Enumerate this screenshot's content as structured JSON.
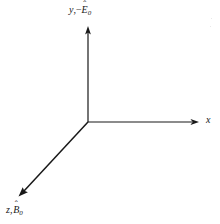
{
  "figure": {
    "type": "coordinate-axes-diagram",
    "background_color": "#ffffff",
    "stroke_color": "#181818",
    "width": 220,
    "height": 224,
    "origin": {
      "x": 88,
      "y": 122
    },
    "axes": [
      {
        "id": "y",
        "name": "y-axis",
        "direction": "up",
        "from": {
          "x": 88,
          "y": 122
        },
        "to": {
          "x": 88,
          "y": 27
        },
        "arrow": true,
        "label": {
          "variable": "y",
          "separator": ",",
          "sign": "−",
          "symbol": "E",
          "accent": "ˆ",
          "subscript": "0",
          "text": "y, −Ê₀"
        }
      },
      {
        "id": "x",
        "name": "x-axis",
        "direction": "right",
        "from": {
          "x": 88,
          "y": 122
        },
        "to": {
          "x": 199,
          "y": 122
        },
        "arrow": true,
        "label": {
          "variable": "x",
          "separator": "",
          "sign": "",
          "symbol": "",
          "accent": "",
          "subscript": "",
          "text": "x"
        }
      },
      {
        "id": "z",
        "name": "z-axis",
        "direction": "down-left",
        "from": {
          "x": 88,
          "y": 122
        },
        "to": {
          "x": 19,
          "y": 196
        },
        "arrow": true,
        "label": {
          "variable": "z",
          "separator": ",",
          "sign": "",
          "symbol": "B",
          "accent": "ˆ",
          "subscript": "0",
          "text": "z, B̂₀"
        }
      }
    ]
  }
}
